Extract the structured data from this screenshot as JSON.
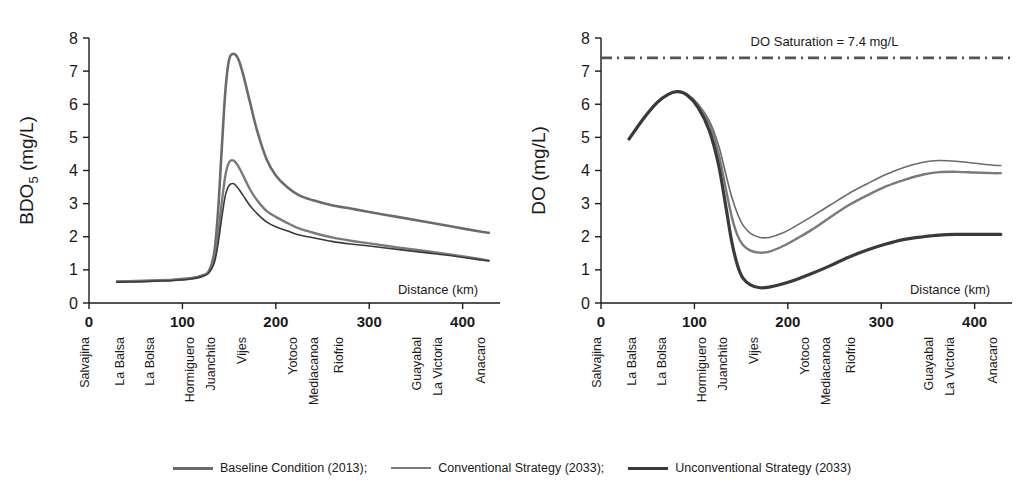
{
  "legend": {
    "entries": [
      {
        "label": "Baseline Condition (2013);",
        "swatch": "line-thick-gray",
        "color": "#6b6b6b"
      },
      {
        "label": "Conventional Strategy (2033);",
        "swatch": "line-medium-gray",
        "color": "#7a7a7a"
      },
      {
        "label": "Unconventional Strategy (2033)",
        "swatch": "line-thick-dark",
        "color": "#3a3a3a"
      }
    ]
  },
  "stations": [
    {
      "name": "Salvajina",
      "km": 0
    },
    {
      "name": "La Balsa",
      "km": 37
    },
    {
      "name": "La Bolsa",
      "km": 70
    },
    {
      "name": "Hormiguero",
      "km": 112
    },
    {
      "name": "Juanchito",
      "km": 135
    },
    {
      "name": "Vijes",
      "km": 168
    },
    {
      "name": "Yotoco",
      "km": 223
    },
    {
      "name": "Mediacanoa",
      "km": 245
    },
    {
      "name": "Riofrio",
      "km": 272
    },
    {
      "name": "Guayabal",
      "km": 355
    },
    {
      "name": "La Victoria",
      "km": 378
    },
    {
      "name": "Anacaro",
      "km": 424
    }
  ],
  "xticks": [
    0,
    100,
    200,
    300,
    400
  ],
  "yticks": [
    0,
    1,
    2,
    3,
    4,
    5,
    6,
    7,
    8
  ],
  "chart_data": [
    {
      "type": "line",
      "id": "bod5",
      "title": "",
      "xlabel": "Distance (km)",
      "ylabel": "BDO5 (mg/L)",
      "ylabel_main": "BDO",
      "ylabel_sub": "5",
      "ylabel_unit": " (mg/L)",
      "xlim": [
        0,
        440
      ],
      "ylim": [
        0,
        8
      ],
      "grid": false,
      "legend_position": "below-figure",
      "series": [
        {
          "name": "Baseline Condition (2013)",
          "color": "#6b6b6b",
          "width": 2.6,
          "x": [
            30,
            50,
            70,
            90,
            110,
            120,
            128,
            134,
            138,
            142,
            146,
            150,
            155,
            160,
            165,
            172,
            180,
            190,
            200,
            212,
            225,
            240,
            260,
            280,
            300,
            330,
            360,
            390,
            420,
            428
          ],
          "y": [
            0.65,
            0.66,
            0.68,
            0.7,
            0.75,
            0.82,
            0.95,
            1.5,
            2.7,
            4.6,
            6.4,
            7.35,
            7.52,
            7.35,
            6.9,
            6.1,
            5.2,
            4.35,
            3.85,
            3.5,
            3.25,
            3.1,
            2.95,
            2.85,
            2.75,
            2.6,
            2.45,
            2.3,
            2.15,
            2.12
          ]
        },
        {
          "name": "Conventional Strategy (2033)",
          "color": "#7a7a7a",
          "width": 2.4,
          "x": [
            30,
            50,
            70,
            90,
            110,
            120,
            128,
            134,
            138,
            142,
            146,
            150,
            155,
            160,
            165,
            172,
            180,
            190,
            200,
            212,
            225,
            240,
            260,
            280,
            300,
            330,
            360,
            390,
            420,
            428
          ],
          "y": [
            0.64,
            0.65,
            0.67,
            0.69,
            0.74,
            0.8,
            0.92,
            1.3,
            2.0,
            3.0,
            3.85,
            4.25,
            4.3,
            4.12,
            3.85,
            3.45,
            3.1,
            2.78,
            2.6,
            2.42,
            2.25,
            2.12,
            1.98,
            1.88,
            1.8,
            1.68,
            1.57,
            1.45,
            1.32,
            1.28
          ]
        },
        {
          "name": "Unconventional Strategy (2033)",
          "color": "#3a3a3a",
          "width": 1.6,
          "x": [
            30,
            50,
            70,
            90,
            110,
            120,
            128,
            134,
            138,
            142,
            146,
            150,
            155,
            160,
            165,
            172,
            180,
            190,
            200,
            212,
            225,
            240,
            260,
            280,
            300,
            330,
            360,
            390,
            420,
            428
          ],
          "y": [
            0.63,
            0.64,
            0.66,
            0.68,
            0.73,
            0.79,
            0.9,
            1.2,
            1.75,
            2.55,
            3.25,
            3.55,
            3.6,
            3.45,
            3.25,
            2.95,
            2.7,
            2.45,
            2.3,
            2.18,
            2.05,
            1.97,
            1.86,
            1.78,
            1.72,
            1.62,
            1.52,
            1.42,
            1.3,
            1.27
          ]
        }
      ]
    },
    {
      "type": "line",
      "id": "do",
      "title": "",
      "xlabel": "Distance (km)",
      "ylabel": "DO (mg/L)",
      "xlim": [
        0,
        440
      ],
      "ylim": [
        0,
        8
      ],
      "grid": false,
      "legend_position": "below-figure",
      "annotations": [
        {
          "text": "DO Saturation = 7.4 mg/L",
          "value": 7.4,
          "style": "dash-dot",
          "color": "#555555"
        }
      ],
      "reference_line": {
        "label": "DO Saturation = 7.4 mg/L",
        "value": 7.4
      },
      "series": [
        {
          "name": "Baseline Condition (2013)",
          "color": "#6b6b6b",
          "width": 1.6,
          "x": [
            30,
            45,
            60,
            72,
            82,
            92,
            104,
            116,
            126,
            134,
            140,
            146,
            152,
            160,
            170,
            180,
            195,
            210,
            225,
            245,
            265,
            285,
            305,
            325,
            345,
            362,
            380,
            400,
            420,
            428
          ],
          "y": [
            4.95,
            5.55,
            6.05,
            6.3,
            6.38,
            6.3,
            6.0,
            5.5,
            4.75,
            3.85,
            3.2,
            2.7,
            2.35,
            2.1,
            1.98,
            1.98,
            2.12,
            2.35,
            2.6,
            2.95,
            3.3,
            3.6,
            3.88,
            4.1,
            4.25,
            4.3,
            4.28,
            4.22,
            4.16,
            4.15
          ]
        },
        {
          "name": "Conventional Strategy (2033)",
          "color": "#7a7a7a",
          "width": 2.4,
          "x": [
            30,
            45,
            60,
            72,
            82,
            92,
            104,
            116,
            126,
            134,
            140,
            146,
            152,
            160,
            170,
            180,
            195,
            210,
            225,
            245,
            265,
            285,
            305,
            325,
            345,
            362,
            380,
            400,
            420,
            428
          ],
          "y": [
            4.95,
            5.55,
            6.05,
            6.3,
            6.38,
            6.3,
            5.98,
            5.4,
            4.5,
            3.4,
            2.6,
            2.05,
            1.75,
            1.58,
            1.52,
            1.55,
            1.72,
            1.95,
            2.2,
            2.58,
            2.95,
            3.25,
            3.52,
            3.72,
            3.88,
            3.95,
            3.96,
            3.94,
            3.92,
            3.92
          ]
        },
        {
          "name": "Unconventional Strategy (2033)",
          "color": "#3a3a3a",
          "width": 3.2,
          "x": [
            30,
            45,
            60,
            72,
            82,
            92,
            104,
            116,
            126,
            134,
            140,
            146,
            152,
            160,
            170,
            180,
            195,
            210,
            225,
            245,
            265,
            285,
            305,
            325,
            345,
            362,
            380,
            400,
            420,
            428
          ],
          "y": [
            4.95,
            5.55,
            6.05,
            6.3,
            6.38,
            6.28,
            5.9,
            5.2,
            4.15,
            2.85,
            1.85,
            1.15,
            0.75,
            0.55,
            0.46,
            0.48,
            0.58,
            0.72,
            0.88,
            1.12,
            1.38,
            1.6,
            1.78,
            1.92,
            2.0,
            2.05,
            2.07,
            2.07,
            2.07,
            2.07
          ]
        }
      ]
    }
  ]
}
